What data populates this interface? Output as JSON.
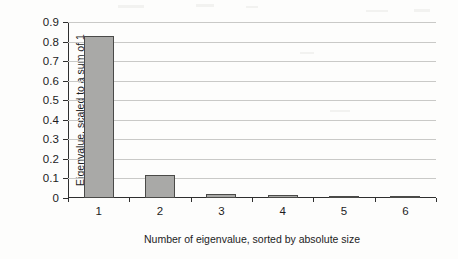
{
  "chart_data": {
    "type": "bar",
    "title": "",
    "subtitle": "",
    "xlabel": "Number of eigenvalue, sorted by absolute size",
    "ylabel": "Eigenvalue, scaled to a sum of 1",
    "categories": [
      "1",
      "2",
      "3",
      "4",
      "5",
      "6"
    ],
    "values": [
      0.83,
      0.12,
      0.02,
      0.015,
      0.005,
      0.003
    ],
    "series": [
      {
        "name": "Eigenvalue",
        "values": [
          0.83,
          0.12,
          0.02,
          0.015,
          0.005,
          0.003
        ]
      }
    ],
    "ylim": [
      0,
      0.9
    ],
    "ytick_labels": [
      "0.9",
      "0.8",
      "0.7",
      "0.6",
      "0.5",
      "0.4",
      "0.3",
      "0.2",
      "0.1",
      "0"
    ],
    "ytick_values": [
      0.9,
      0.8,
      0.7,
      0.6,
      0.5,
      0.4,
      0.3,
      0.2,
      0.1,
      0
    ],
    "grid": true,
    "grid_orientation": "horizontal",
    "legend": false,
    "legend_position": "none",
    "bar_fill_color": "#a9a9a7",
    "bar_edge_color": "#4a4a48",
    "grid_color": "#c9c9c7",
    "axis_color": "#2f2f2f",
    "background_color": "#fdfdfc"
  }
}
